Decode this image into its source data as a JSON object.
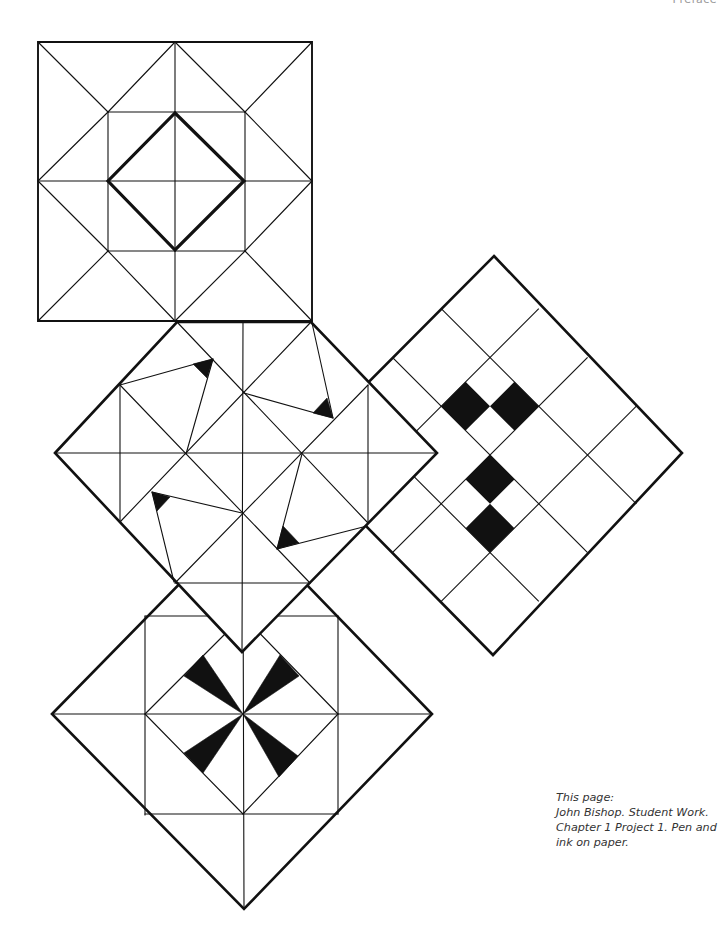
{
  "header": {
    "running_title": "Preface"
  },
  "caption": {
    "lines": [
      "This page:",
      "John Bishop. Student Work.",
      "Chapter 1   Project 1. Pen and",
      "ink on paper."
    ]
  },
  "artwork": {
    "stroke_color": "#111111",
    "fill_color": "#111111",
    "thin_width": 1.1,
    "thick_width": 2.6,
    "panels": [
      {
        "name": "right-grid-diamond",
        "outline": [
          [
            494,
            256
          ],
          [
            682,
            453
          ],
          [
            493,
            655
          ],
          [
            296,
            455
          ]
        ],
        "rotated_grid": {
          "center": [
            490,
            455
          ],
          "half": 138,
          "cell": 69,
          "rotation": 45,
          "lines_u": [
            1,
            2,
            3
          ],
          "lines_v": [
            1,
            2,
            3
          ],
          "black_cells": [
            {
              "u": [
                1,
                1.5
              ],
              "v": [
                1.5,
                2
              ]
            },
            {
              "u": [
                1.5,
                2
              ],
              "v": [
                1,
                1.5
              ]
            },
            {
              "u": [
                2,
                2.5
              ],
              "v": [
                2,
                2.5
              ]
            },
            {
              "u": [
                2.5,
                3
              ],
              "v": [
                2.5,
                3
              ]
            }
          ]
        }
      },
      {
        "name": "bottom-pinwheel-diamond",
        "outline": [
          [
            52,
            714
          ],
          [
            243,
            519
          ],
          [
            432,
            714
          ],
          [
            244,
            909
          ]
        ],
        "thin_lines": [
          [
            [
              52,
              714
            ],
            [
              432,
              714
            ]
          ],
          [
            [
              243,
              560
            ],
            [
              244,
              909
            ]
          ],
          [
            [
              145,
              616
            ],
            [
              145,
              815
            ]
          ],
          [
            [
              338,
              616
            ],
            [
              338,
              814
            ]
          ],
          [
            [
              145,
              616
            ],
            [
              338,
              616
            ]
          ],
          [
            [
              145,
              814
            ],
            [
              338,
              814
            ]
          ],
          [
            [
              145,
              714
            ],
            [
              243,
              616
            ]
          ],
          [
            [
              243,
              616
            ],
            [
              338,
              714
            ]
          ],
          [
            [
              338,
              714
            ],
            [
              243,
              814
            ]
          ],
          [
            [
              243,
              814
            ],
            [
              145,
              714
            ]
          ]
        ],
        "black_triangles": [
          [
            [
              184,
              676
            ],
            [
              203,
              655
            ],
            [
              243,
              714
            ]
          ],
          [
            [
              280,
              655
            ],
            [
              299,
              676
            ],
            [
              243,
              714
            ]
          ],
          [
            [
              184,
              753
            ],
            [
              203,
              773
            ],
            [
              243,
              714
            ]
          ],
          [
            [
              279,
              777
            ],
            [
              298,
              756
            ],
            [
              243,
              714
            ]
          ]
        ]
      },
      {
        "name": "middle-pinwheel-diamond",
        "outline": [
          [
            55,
            453
          ],
          [
            177,
            322
          ],
          [
            311,
            322
          ],
          [
            437,
            453
          ],
          [
            242,
            652
          ]
        ],
        "thin_lines": [
          [
            [
              55,
              453
            ],
            [
              437,
              453
            ]
          ],
          [
            [
              243,
              322
            ],
            [
              242,
              652
            ]
          ],
          [
            [
              120,
              385
            ],
            [
              120,
              522
            ]
          ],
          [
            [
              368,
              385
            ],
            [
              368,
              523
            ]
          ],
          [
            [
              175,
              583
            ],
            [
              310,
              583
            ]
          ],
          [
            [
              177,
              322
            ],
            [
              368,
              523
            ]
          ],
          [
            [
              311,
              322
            ],
            [
              120,
              522
            ]
          ],
          [
            [
              120,
              385
            ],
            [
              310,
              583
            ]
          ],
          [
            [
              368,
              385
            ],
            [
              175,
              583
            ]
          ],
          [
            [
              120,
              385
            ],
            [
              213,
              359
            ]
          ],
          [
            [
              213,
              359
            ],
            [
              186,
              454
            ]
          ],
          [
            [
              312,
              323
            ],
            [
              333,
              418
            ]
          ],
          [
            [
              333,
              418
            ],
            [
              244,
              393
            ]
          ],
          [
            [
              242,
              513
            ],
            [
              152,
              492
            ]
          ],
          [
            [
              152,
              492
            ],
            [
              174,
              582
            ]
          ],
          [
            [
              302,
              454
            ],
            [
              277,
              549
            ]
          ],
          [
            [
              277,
              549
            ],
            [
              367,
              526
            ]
          ]
        ],
        "black_triangles": [
          [
            [
              193,
              364
            ],
            [
              213,
              359
            ],
            [
              207,
              378
            ]
          ],
          [
            [
              313,
              413
            ],
            [
              333,
              418
            ],
            [
              327,
              398
            ]
          ],
          [
            [
              152,
              492
            ],
            [
              170,
              497
            ],
            [
              157,
              511
            ]
          ],
          [
            [
              277,
              549
            ],
            [
              283,
              526
            ],
            [
              299,
              543
            ]
          ]
        ]
      },
      {
        "name": "top-star-square",
        "outline": [
          [
            38,
            42
          ],
          [
            312,
            42
          ],
          [
            312,
            321
          ],
          [
            38,
            321
          ]
        ],
        "thin_lines": [
          [
            [
              175,
              42
            ],
            [
              175,
              321
            ]
          ],
          [
            [
              38,
              181
            ],
            [
              312,
              181
            ]
          ],
          [
            [
              108,
              112
            ],
            [
              245,
              112
            ]
          ],
          [
            [
              245,
              112
            ],
            [
              245,
              251
            ]
          ],
          [
            [
              245,
              251
            ],
            [
              108,
              251
            ]
          ],
          [
            [
              108,
              251
            ],
            [
              108,
              112
            ]
          ],
          [
            [
              38,
              42
            ],
            [
              108,
              112
            ]
          ],
          [
            [
              312,
              42
            ],
            [
              245,
              112
            ]
          ],
          [
            [
              38,
              321
            ],
            [
              108,
              251
            ]
          ],
          [
            [
              312,
              321
            ],
            [
              245,
              251
            ]
          ],
          [
            [
              108,
              112
            ],
            [
              175,
              42
            ]
          ],
          [
            [
              245,
              112
            ],
            [
              175,
              42
            ]
          ],
          [
            [
              108,
              112
            ],
            [
              38,
              181
            ]
          ],
          [
            [
              108,
              251
            ],
            [
              38,
              181
            ]
          ],
          [
            [
              245,
              112
            ],
            [
              312,
              181
            ]
          ],
          [
            [
              245,
              251
            ],
            [
              312,
              181
            ]
          ],
          [
            [
              108,
              251
            ],
            [
              175,
              321
            ]
          ],
          [
            [
              245,
              251
            ],
            [
              175,
              321
            ]
          ]
        ],
        "thick_polygons": [
          [
            [
              175,
              113
            ],
            [
              244,
              181
            ],
            [
              175,
              250
            ],
            [
              108,
              181
            ]
          ]
        ]
      }
    ]
  }
}
